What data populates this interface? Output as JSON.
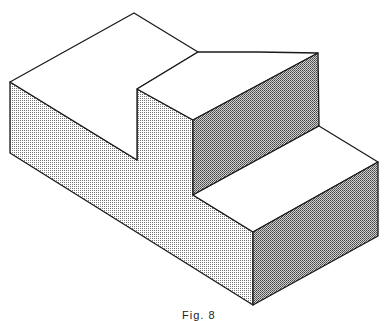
{
  "figure": {
    "caption": "Fig. 8",
    "colors": {
      "line": "#1a1a1a",
      "top_faces": "#ffffff",
      "shade_light": "#c8c8c8",
      "shade_dark": "#a8a8a8"
    }
  }
}
